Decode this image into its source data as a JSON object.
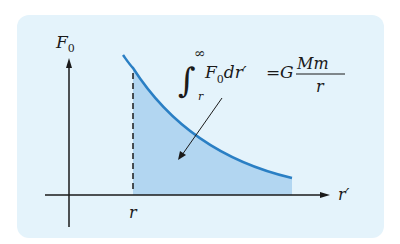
{
  "diagram": {
    "y_axis_label": "F",
    "y_axis_sub": "0",
    "x_axis_label": "r′",
    "marker_label": "r",
    "equation": {
      "integral_lower": "r",
      "integral_upper": "∞",
      "integrand": "F",
      "integrand_sub": "0",
      "differential": "dr′",
      "equals": "=",
      "constant": "G",
      "numerator": "Mm",
      "denominator": "r"
    },
    "colors": {
      "panel_background": "#e4f3fb",
      "curve": "#2a7fc4",
      "shaded_area": "#a9d0ee",
      "axes": "#1a1a1a"
    }
  }
}
